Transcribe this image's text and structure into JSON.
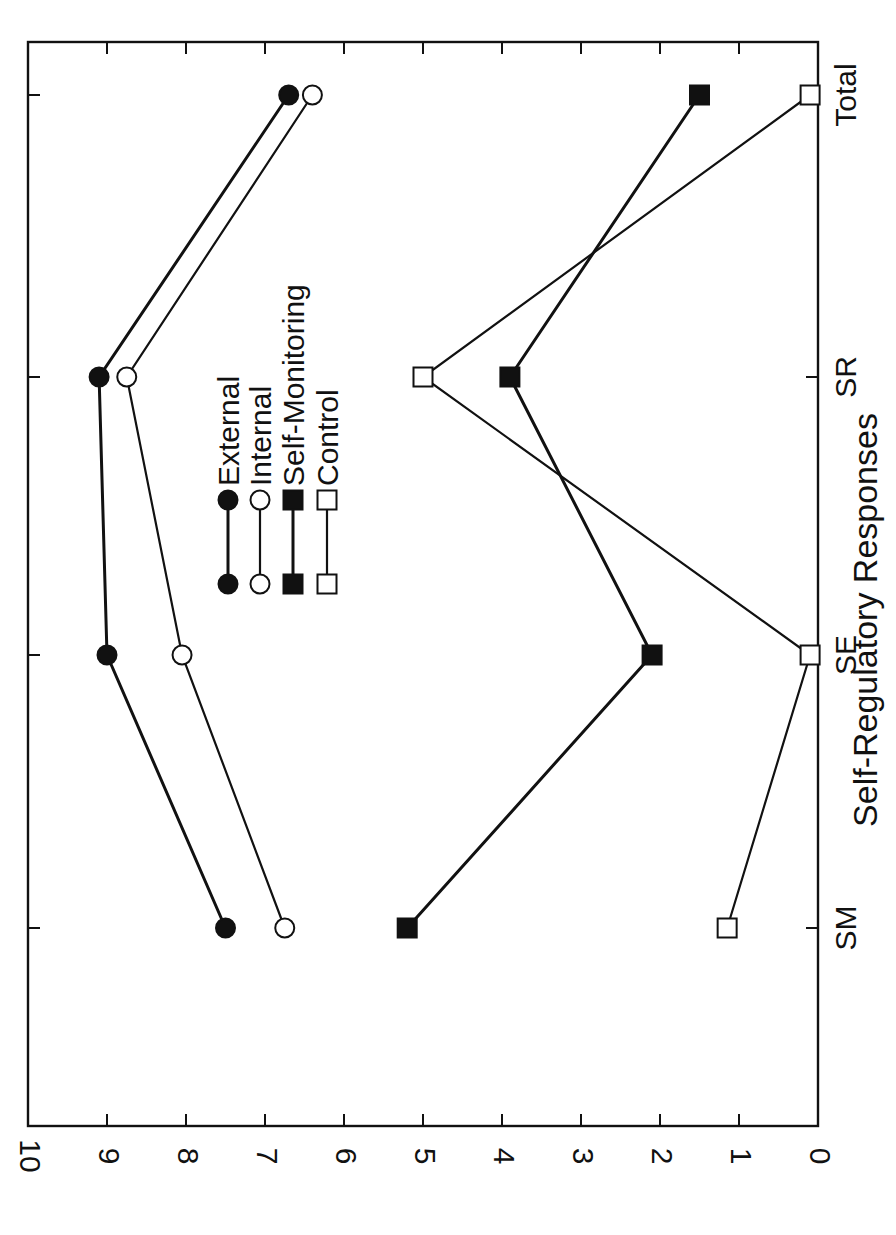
{
  "chart_data": {
    "type": "line",
    "title": "",
    "xlabel": "Self-Regulatory Responses",
    "ylabel": "Number of Correct Responses",
    "categories": [
      "SM",
      "SE",
      "SR",
      "Total"
    ],
    "ylim": [
      0,
      10
    ],
    "yticks": [
      0,
      1,
      2,
      3,
      4,
      5,
      6,
      7,
      8,
      9,
      10
    ],
    "grid": false,
    "orientation": "rotated-90",
    "legend_position": "inside-center",
    "series": [
      {
        "name": "External",
        "marker": "filled-circle",
        "values": [
          7.5,
          9.0,
          9.1,
          6.7
        ]
      },
      {
        "name": "Internal",
        "marker": "open-circle",
        "values": [
          6.75,
          8.05,
          8.75,
          6.4
        ]
      },
      {
        "name": "Self-Monitoring",
        "marker": "filled-square",
        "values": [
          5.2,
          2.1,
          3.9,
          1.5
        ]
      },
      {
        "name": "Control",
        "marker": "open-square",
        "values": [
          1.15,
          0.1,
          5.0,
          0.1
        ]
      }
    ]
  },
  "axis": {
    "ylabel": "Number of Correct Responses",
    "xlabel": "Self-Regulatory Responses",
    "tick_labels": [
      "0",
      "1",
      "2",
      "3",
      "4",
      "5",
      "6",
      "7",
      "8",
      "9",
      "10"
    ],
    "category_labels": [
      "SM",
      "SE",
      "SR",
      "Total"
    ]
  },
  "legend": {
    "items": [
      "External",
      "Internal",
      "Self-Monitoring",
      "Control"
    ]
  },
  "colors": {
    "ink": "#111111",
    "background": "#ffffff"
  }
}
